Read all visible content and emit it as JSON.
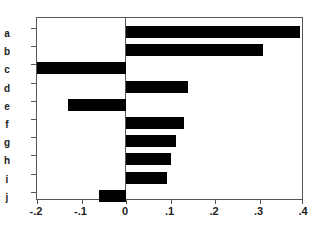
{
  "chart_data": {
    "type": "bar",
    "orientation": "horizontal",
    "title": "",
    "xlabel": "",
    "ylabel": "",
    "categories": [
      "a",
      "b",
      "c",
      "d",
      "e",
      "f",
      "g",
      "h",
      "i",
      "j"
    ],
    "values": [
      0.39,
      0.307,
      -0.2,
      0.14,
      -0.13,
      0.13,
      0.112,
      0.1,
      0.092,
      -0.06
    ],
    "xlim": [
      -0.2,
      0.4
    ],
    "xticks": [
      -0.2,
      -0.1,
      0,
      0.1,
      0.2,
      0.3,
      0.4
    ],
    "xtick_labels": [
      "-.2",
      "-.1",
      "0",
      ".1",
      ".2",
      ".3",
      ".4"
    ],
    "grid": false,
    "legend": null,
    "reference_line": 0,
    "bar_color": "#000000"
  }
}
